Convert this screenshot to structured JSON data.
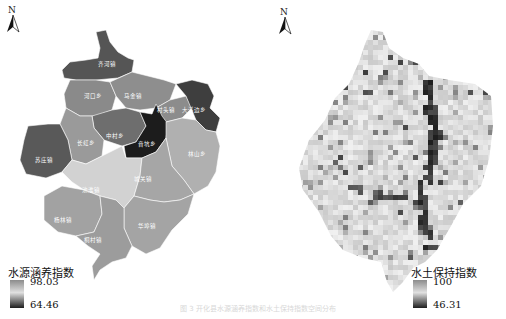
{
  "left_map": {
    "north_label": "N",
    "legend": {
      "title": "水源涵养指数",
      "max": "98.03",
      "min": "64.46"
    },
    "regions": [
      {
        "name": "齐河镇",
        "shade": "#555555"
      },
      {
        "name": "河口乡",
        "shade": "#8a8a8a"
      },
      {
        "name": "马金镇",
        "shade": "#8e8e8e"
      },
      {
        "name": "村头镇",
        "shade": "#8c8c8c"
      },
      {
        "name": "大溪边乡",
        "shade": "#3e3e3e"
      },
      {
        "name": "中村乡",
        "shade": "#6e6e6e"
      },
      {
        "name": "长虹乡",
        "shade": "#9a9a9a"
      },
      {
        "name": "苏庄镇",
        "shade": "#595959"
      },
      {
        "name": "音坑乡",
        "shade": "#1c1c1c"
      },
      {
        "name": "林山乡",
        "shade": "#b0b0b0"
      },
      {
        "name": "池淮镇",
        "shade": "#d2d2d2"
      },
      {
        "name": "城关镇",
        "shade": "#a6a6a6"
      },
      {
        "name": "杨林镇",
        "shade": "#a2a2a2"
      },
      {
        "name": "华埠镇",
        "shade": "#a4a4a4"
      },
      {
        "name": "桐村镇",
        "shade": "#9c9c9c"
      }
    ]
  },
  "right_map": {
    "north_label": "N",
    "legend": {
      "title": "水土保持指数",
      "max": "100",
      "min": "46.31"
    }
  },
  "caption": "图 3 开化县水源涵养指数和水土保持指数空间分布"
}
